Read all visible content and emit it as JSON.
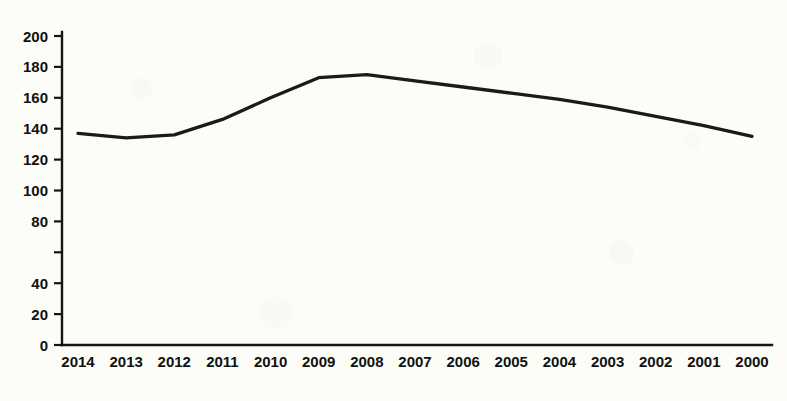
{
  "chart_data": {
    "type": "line",
    "title": "",
    "subtitle": "",
    "xlabel": "",
    "ylabel": "",
    "categories": [
      "2014",
      "2013",
      "2012",
      "2011",
      "2010",
      "2009",
      "2008",
      "2007",
      "2006",
      "2005",
      "2004",
      "2003",
      "2002",
      "2001",
      "2000"
    ],
    "values": [
      137,
      134,
      136,
      146,
      160,
      173,
      175,
      171,
      167,
      163,
      159,
      154,
      148,
      142,
      135
    ],
    "series": [
      {
        "name": "",
        "values": [
          137,
          134,
          136,
          146,
          160,
          173,
          175,
          171,
          167,
          163,
          159,
          154,
          148,
          142,
          135
        ]
      }
    ],
    "ylim": [
      0,
      200
    ],
    "y_ticks": [
      0,
      20,
      40,
      60,
      80,
      100,
      120,
      140,
      160,
      180,
      200
    ],
    "y_tick_labels": [
      "0",
      "20",
      "40",
      "",
      "80",
      "100",
      "120",
      "140",
      "160",
      "180",
      "200"
    ],
    "x_tick_labels": [
      "2014",
      "2013",
      "2012",
      "2011",
      "2010",
      "2009",
      "2008",
      "2007",
      "2006",
      "2005",
      "2004",
      "2003",
      "2002",
      "2001",
      "2000"
    ],
    "grid": false,
    "legend": false,
    "legend_position": "none",
    "annotations": [],
    "line_color": "#1a1a1a",
    "axis_color": "#141414",
    "background_color": "#fdfdf8"
  }
}
